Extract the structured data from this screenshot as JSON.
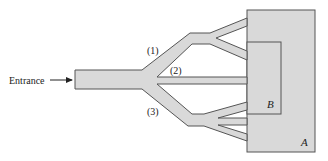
{
  "diagram": {
    "type": "flow-network",
    "entrance_label": "Entrance",
    "branch_labels": [
      "(1)",
      "(2)",
      "(3)"
    ],
    "region_labels": {
      "outer": "A",
      "inner": "B"
    }
  },
  "colors": {
    "fill": "#d9d9d9",
    "stroke": "#555555",
    "text": "#222222",
    "background": "#ffffff"
  }
}
